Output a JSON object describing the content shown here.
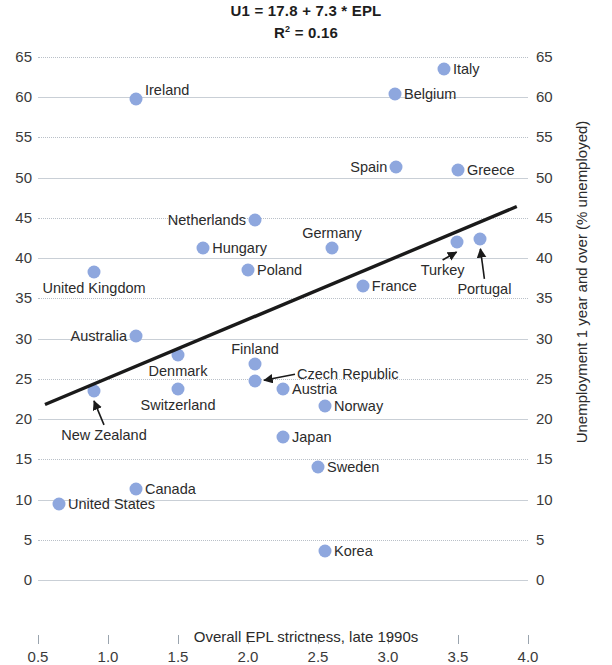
{
  "title": {
    "equation": "U1 = 17.8 + 7.3 * EPL",
    "r_squared_prefix": "R",
    "r_squared_sup": "2",
    "r_squared_value": " = 0.16"
  },
  "axes": {
    "x_title": "Overall EPL strictness, late 1990s",
    "y_title": "Unemployment 1 year and over (% unemployed)"
  },
  "colors": {
    "point": "#8ea7de",
    "trendline": "#1a1a1a",
    "gridline": "#c9cfd6",
    "text": "#2b2b2b"
  },
  "chart_data": {
    "type": "scatter",
    "title": "U1 = 17.8 + 7.3 * EPL",
    "subtitle": "R² = 0.16",
    "xlabel": "Overall EPL strictness, late 1990s",
    "ylabel": "Unemployment 1 year and over (% unemployed)",
    "xlim": [
      0.5,
      4.0
    ],
    "ylim": [
      0,
      65
    ],
    "xticks": [
      "0.5",
      "1.0",
      "1.5",
      "2.0",
      "2.5",
      "3.0",
      "3.5",
      "4.0"
    ],
    "xtick_values": [
      0.5,
      1.0,
      1.5,
      2.0,
      2.5,
      3.0,
      3.5,
      4.0
    ],
    "yticks": [
      "0",
      "5",
      "10",
      "15",
      "20",
      "25",
      "30",
      "35",
      "40",
      "45",
      "50",
      "55",
      "60",
      "65"
    ],
    "ytick_values": [
      0,
      5,
      10,
      15,
      20,
      25,
      30,
      35,
      40,
      45,
      50,
      55,
      60,
      65
    ],
    "grid": true,
    "legend": "none",
    "regression": {
      "equation": "U1 = 17.8 + 7.3 * EPL",
      "intercept": 17.8,
      "slope": 7.3,
      "r_squared": 0.16,
      "x_start": 0.55,
      "x_end": 3.92
    },
    "points": [
      {
        "label": "Italy",
        "x": 3.4,
        "y": 63.5,
        "anchor": "right"
      },
      {
        "label": "Belgium",
        "x": 3.05,
        "y": 60.4,
        "anchor": "right"
      },
      {
        "label": "Ireland",
        "x": 1.2,
        "y": 59.8,
        "anchor": "right-up"
      },
      {
        "label": "Spain",
        "x": 3.06,
        "y": 51.3,
        "anchor": "left"
      },
      {
        "label": "Greece",
        "x": 3.5,
        "y": 51.0,
        "anchor": "right"
      },
      {
        "label": "Netherlands",
        "x": 2.05,
        "y": 44.8,
        "anchor": "left"
      },
      {
        "label": "Portugal",
        "x": 3.66,
        "y": 42.4,
        "anchor": "callout-down"
      },
      {
        "label": "Turkey",
        "x": 3.49,
        "y": 42.0,
        "anchor": "callout-down"
      },
      {
        "label": "Germany",
        "x": 2.6,
        "y": 41.3,
        "anchor": "above"
      },
      {
        "label": "Hungary",
        "x": 1.68,
        "y": 41.2,
        "anchor": "right"
      },
      {
        "label": "Poland",
        "x": 2.0,
        "y": 38.5,
        "anchor": "right"
      },
      {
        "label": "United Kingdom",
        "x": 0.9,
        "y": 38.3,
        "anchor": "below"
      },
      {
        "label": "France",
        "x": 2.82,
        "y": 36.6,
        "anchor": "right"
      },
      {
        "label": "Australia",
        "x": 1.2,
        "y": 30.3,
        "anchor": "left"
      },
      {
        "label": "Denmark",
        "x": 1.5,
        "y": 28.0,
        "anchor": "below"
      },
      {
        "label": "Finland",
        "x": 2.05,
        "y": 26.8,
        "anchor": "above"
      },
      {
        "label": "Czech Republic",
        "x": 2.05,
        "y": 24.7,
        "anchor": "callout-right"
      },
      {
        "label": "Austria",
        "x": 2.25,
        "y": 23.8,
        "anchor": "right"
      },
      {
        "label": "Switzerland",
        "x": 1.5,
        "y": 23.8,
        "anchor": "below"
      },
      {
        "label": "New Zealand",
        "x": 0.9,
        "y": 23.5,
        "anchor": "callout-down"
      },
      {
        "label": "Norway",
        "x": 2.55,
        "y": 21.6,
        "anchor": "right"
      },
      {
        "label": "Japan",
        "x": 2.25,
        "y": 17.8,
        "anchor": "right"
      },
      {
        "label": "Sweden",
        "x": 2.5,
        "y": 14.0,
        "anchor": "right"
      },
      {
        "label": "Canada",
        "x": 1.2,
        "y": 11.3,
        "anchor": "right"
      },
      {
        "label": "United States",
        "x": 0.65,
        "y": 9.4,
        "anchor": "right"
      },
      {
        "label": "Korea",
        "x": 2.55,
        "y": 3.6,
        "anchor": "right"
      }
    ]
  }
}
